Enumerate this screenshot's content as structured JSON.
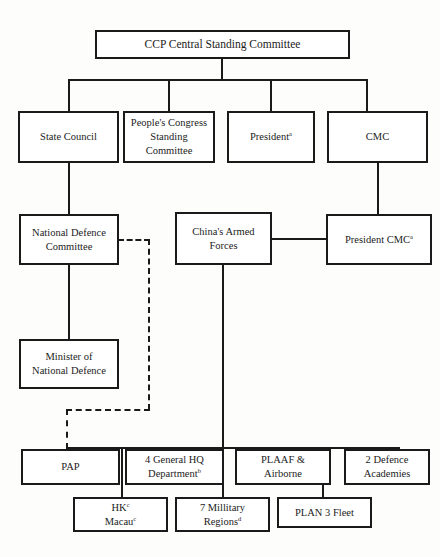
{
  "diagram": {
    "type": "organizational-chart",
    "colors": {
      "line": "#1a1a1a",
      "box_fill": "#ffffff",
      "background": "#fdfdfc",
      "text": "#1b1b1b"
    },
    "nodes": {
      "ccp": {
        "label": "CCP Central Standing Committee"
      },
      "state_council": {
        "label": "State Council"
      },
      "peoples_congress": {
        "label": "People's Congress\nStanding\nCommittee"
      },
      "president": {
        "label": "President",
        "superscript": "a"
      },
      "cmc": {
        "label": "CMC"
      },
      "national_defence_committee": {
        "label": "National Defence\nCommittee"
      },
      "chinas_armed_forces": {
        "label": "China's Armed\nForces"
      },
      "president_cmc": {
        "label": "President CMC",
        "superscript": "a"
      },
      "minister_national_defence": {
        "label": "Minister of\nNational Defence"
      },
      "pap": {
        "label": "PAP"
      },
      "general_hq": {
        "label": "4 General HQ\nDepartment",
        "superscript": "b"
      },
      "plaaf": {
        "label": "PLAAF &\nAirborne"
      },
      "defence_academies": {
        "label": "2 Defence\nAcademies"
      },
      "hk_macau_line1": {
        "label": "HK",
        "superscript": "c"
      },
      "hk_macau_line2": {
        "label": "Macau",
        "superscript": "c"
      },
      "military_regions": {
        "label": "7 Millitary\nRegions",
        "superscript": "d"
      },
      "plan_fleet": {
        "label": "PLAN 3 Fleet"
      }
    }
  }
}
